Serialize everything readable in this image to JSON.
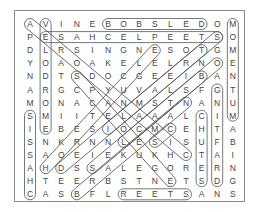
{
  "puzzle": {
    "type": "word-search",
    "rows": 14,
    "cols": 14,
    "grid": [
      "AVINEBOBSLEDOM",
      "PESAHCELPEETSO",
      "DLRSINGNESOTGM",
      "YOAOAKELELRNOE",
      "NDTSDOCGEEIBAN",
      "ARGCPYUVALSFGT",
      "MONACANMSTNANU",
      "SMIITELAAALCIM",
      "IEBESIOCMCEHTA",
      "SNKRNNLESISUFB",
      "SAOEIEKUKHCTAI",
      "AHDSSALEGORERN",
      "HTEERBSTNETSDG",
      "CASBFLREETSANS"
    ],
    "found_words": [
      {
        "word": "BOBSLED",
        "start": [
          0,
          5
        ],
        "end": [
          0,
          11
        ]
      },
      {
        "word": "STEEPLECHASE",
        "start": [
          1,
          12
        ],
        "end": [
          1,
          1
        ]
      },
      {
        "word": "VELODROME",
        "start": [
          0,
          1
        ],
        "end": [
          8,
          1
        ]
      },
      {
        "word": "MOMENTUM",
        "start": [
          0,
          13
        ],
        "end": [
          7,
          13
        ]
      },
      {
        "word": "CHASSIS",
        "start": [
          13,
          0
        ],
        "end": [
          7,
          0
        ]
      },
      {
        "word": "CHUTES",
        "start": [
          7,
          11
        ],
        "end": [
          12,
          11
        ]
      },
      {
        "word": "DRAFTING",
        "start": [
          12,
          12
        ],
        "end": [
          5,
          12
        ]
      },
      {
        "word": "STEER",
        "start": [
          13,
          10
        ],
        "end": [
          13,
          6
        ]
      },
      {
        "word": "AVALANCHE",
        "start": [
          0,
          0
        ],
        "end": [
          10,
          10
        ]
      },
      {
        "word": "DIAGONAL-1",
        "start": [
          1,
          12
        ],
        "end": [
          8,
          5
        ]
      },
      {
        "word": "DIAGONAL-2",
        "start": [
          2,
          8
        ],
        "end": [
          11,
          1
        ]
      },
      {
        "word": "DIAGONAL-3",
        "start": [
          3,
          12
        ],
        "end": [
          11,
          4
        ]
      },
      {
        "word": "DIAGONAL-4",
        "start": [
          4,
          3
        ],
        "end": [
          12,
          9
        ]
      },
      {
        "word": "DIAGONAL-5",
        "start": [
          6,
          10
        ],
        "end": [
          13,
          3
        ]
      },
      {
        "word": "DIAGONAL-6",
        "start": [
          9,
          6
        ],
        "end": [
          4,
          11
        ]
      },
      {
        "word": "DIAGONAL-7",
        "start": [
          11,
          2
        ],
        "end": [
          2,
          11
        ]
      },
      {
        "word": "DIAGONAL-8",
        "start": [
          8,
          9
        ],
        "end": [
          9,
          8
        ]
      }
    ]
  },
  "layout": {
    "x0": 30,
    "dx": 15.6,
    "y0": 24,
    "dy": 13.1
  },
  "colors": {
    "letter": "#444444",
    "oval": "#555555",
    "border": "#8a8a8a"
  }
}
